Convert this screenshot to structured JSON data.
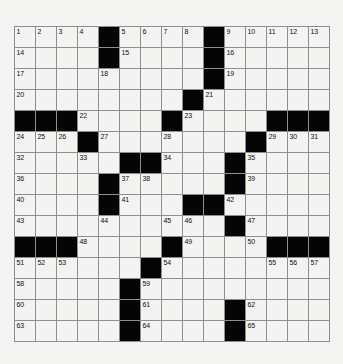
{
  "puzzle": {
    "type": "crossword-grid",
    "rows": 15,
    "cols": 15,
    "cell_size_px": 21,
    "colors": {
      "background": "#f4f4f2",
      "white_cell": "#f3f3f1",
      "black_cell": "#050505",
      "grid_line": "#8e8e8e",
      "number_text": "#111111"
    },
    "numbering_note": "Numbers 1-65 placed at start of across/down entries",
    "grid": [
      [
        "1",
        "2",
        "3",
        "4",
        "#",
        "5",
        "6",
        "7",
        "8",
        "#",
        "9",
        "10",
        "11",
        "12",
        "13"
      ],
      [
        "14",
        "",
        "",
        "",
        "#",
        "15",
        "",
        "",
        "",
        "#",
        "16",
        "",
        "",
        "",
        ""
      ],
      [
        "17",
        "",
        "",
        "",
        "18",
        "",
        "",
        "",
        "",
        "#",
        "19",
        "",
        "",
        "",
        ""
      ],
      [
        "20",
        "",
        "",
        "",
        "",
        "",
        "",
        "",
        "#",
        "21",
        "",
        "",
        "",
        "",
        ""
      ],
      [
        "#",
        "#",
        "#",
        "22",
        "",
        "",
        "",
        "#",
        "23",
        "",
        "",
        "",
        "#",
        "#",
        "#"
      ],
      [
        "24",
        "25",
        "26",
        "#",
        "27",
        "",
        "",
        "28",
        "",
        "",
        "",
        "#",
        "29",
        "30",
        "31"
      ],
      [
        "32",
        "",
        "",
        "33",
        "",
        "#",
        "#",
        "34",
        "",
        "",
        "#",
        "35",
        "",
        "",
        ""
      ],
      [
        "36",
        "",
        "",
        "",
        "#",
        "37",
        "38",
        "",
        "",
        "",
        "#",
        "39",
        "",
        "",
        ""
      ],
      [
        "40",
        "",
        "",
        "",
        "#",
        "41",
        "",
        "",
        "#",
        "#",
        "42",
        "",
        "",
        "",
        ""
      ],
      [
        "43",
        "",
        "",
        "",
        "44",
        "",
        "",
        "45",
        "46",
        "",
        "#",
        "47",
        "",
        "",
        ""
      ],
      [
        "#",
        "#",
        "#",
        "48",
        "",
        "",
        "",
        "#",
        "49",
        "",
        "",
        "50",
        "#",
        "#",
        "#"
      ],
      [
        "51",
        "52",
        "53",
        "",
        "",
        "",
        "#",
        "54",
        "",
        "",
        "",
        "",
        "55",
        "56",
        "57"
      ],
      [
        "58",
        "",
        "",
        "",
        "",
        "#",
        "59",
        "",
        "",
        "",
        "",
        "",
        "",
        "",
        ""
      ],
      [
        "60",
        "",
        "",
        "",
        "",
        "#",
        "61",
        "",
        "",
        "",
        "#",
        "62",
        "",
        "",
        ""
      ],
      [
        "63",
        "",
        "",
        "",
        "",
        "#",
        "64",
        "",
        "",
        "",
        "#",
        "65",
        "",
        "",
        ""
      ]
    ],
    "numbers_present": [
      1,
      2,
      3,
      4,
      5,
      6,
      7,
      8,
      9,
      10,
      11,
      12,
      13,
      14,
      15,
      16,
      17,
      18,
      19,
      20,
      21,
      22,
      23,
      24,
      25,
      26,
      27,
      28,
      29,
      30,
      31,
      32,
      33,
      34,
      35,
      36,
      37,
      38,
      39,
      40,
      41,
      42,
      43,
      44,
      45,
      46,
      47,
      48,
      49,
      50,
      51,
      52,
      53,
      54,
      55,
      56,
      57,
      58,
      59,
      60,
      61,
      62,
      63,
      64,
      65
    ],
    "black_cells": [
      [
        0,
        4
      ],
      [
        0,
        9
      ],
      [
        1,
        4
      ],
      [
        1,
        9
      ],
      [
        2,
        9
      ],
      [
        3,
        8
      ],
      [
        4,
        0
      ],
      [
        4,
        1
      ],
      [
        4,
        2
      ],
      [
        4,
        7
      ],
      [
        4,
        12
      ],
      [
        4,
        13
      ],
      [
        4,
        14
      ],
      [
        5,
        3
      ],
      [
        5,
        11
      ],
      [
        6,
        5
      ],
      [
        6,
        6
      ],
      [
        6,
        10
      ],
      [
        7,
        4
      ],
      [
        7,
        10
      ],
      [
        8,
        4
      ],
      [
        8,
        8
      ],
      [
        8,
        9
      ],
      [
        9,
        10
      ],
      [
        10,
        0
      ],
      [
        10,
        1
      ],
      [
        10,
        2
      ],
      [
        10,
        7
      ],
      [
        10,
        12
      ],
      [
        10,
        13
      ],
      [
        10,
        14
      ],
      [
        11,
        6
      ],
      [
        12,
        5
      ],
      [
        13,
        5
      ],
      [
        13,
        10
      ],
      [
        14,
        5
      ],
      [
        14,
        10
      ]
    ]
  }
}
